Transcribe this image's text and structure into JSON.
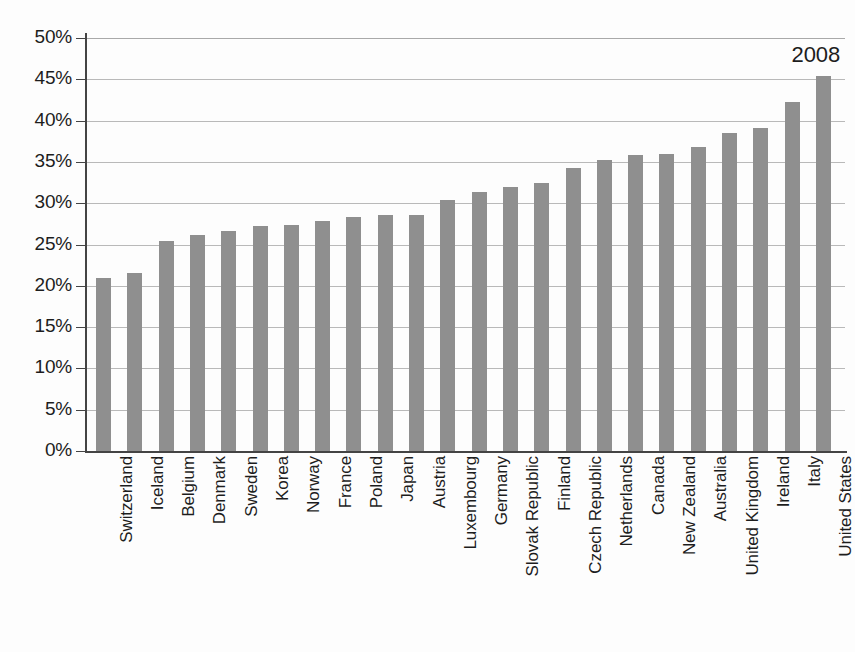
{
  "chart_data": {
    "type": "bar",
    "title": "",
    "subtitle": "",
    "xlabel": "",
    "ylabel": "",
    "ylim": [
      0,
      50
    ],
    "ytick_values": [
      0,
      5,
      10,
      15,
      20,
      25,
      30,
      35,
      40,
      45,
      50
    ],
    "ytick_labels": [
      "0%",
      "5%",
      "10%",
      "15%",
      "20%",
      "25%",
      "30%",
      "35%",
      "40%",
      "45%",
      "50%"
    ],
    "grid": true,
    "legend": null,
    "annotations": [
      {
        "text": "2008",
        "anchor_category": "United States",
        "position": "above-last-bar"
      }
    ],
    "value_unit": "percent",
    "categories": [
      "Switzerland",
      "Iceland",
      "Belgium",
      "Denmark",
      "Sweden",
      "Korea",
      "Norway",
      "France",
      "Poland",
      "Japan",
      "Austria",
      "Luxembourg",
      "Germany",
      "Slovak Republic",
      "Finland",
      "Czech Republic",
      "Netherlands",
      "Canada",
      "New Zealand",
      "Australia",
      "United Kingdom",
      "Ireland",
      "Italy",
      "United States"
    ],
    "values": [
      20.9,
      21.6,
      25.4,
      26.1,
      26.6,
      27.3,
      27.4,
      27.9,
      28.3,
      28.6,
      28.6,
      30.4,
      31.3,
      32.0,
      32.4,
      34.3,
      35.2,
      35.8,
      35.9,
      36.8,
      38.5,
      39.1,
      42.3,
      45.4
    ],
    "series": [
      {
        "name": "2008",
        "color": "#8f8f8f",
        "values": [
          20.9,
          21.6,
          25.4,
          26.1,
          26.6,
          27.3,
          27.4,
          27.9,
          28.3,
          28.6,
          28.6,
          30.4,
          31.3,
          32.0,
          32.4,
          34.3,
          35.2,
          35.8,
          35.9,
          36.8,
          38.5,
          39.1,
          42.3,
          45.4
        ]
      }
    ]
  },
  "style": {
    "bar_color": "#8f8f8f",
    "axis_color": "#444444",
    "gridline_color": "#b9b9b9",
    "text_color": "#1d1d1d",
    "background": "#fdfdfd"
  }
}
